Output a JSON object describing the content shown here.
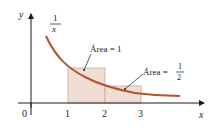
{
  "diagram": {
    "function_label": {
      "numerator": "1",
      "denominator": "x"
    },
    "axis": {
      "x_label": "x",
      "y_label": "y",
      "origin": "0",
      "ticks": [
        "1",
        "2",
        "3"
      ]
    },
    "annotations": {
      "area_one": "Área = 1",
      "area_half_prefix": "Área =",
      "area_half_num": "1",
      "area_half_den": "2"
    },
    "colors": {
      "curve": "#b0552f",
      "rect_fill": "#f0ddd4",
      "rect_stroke": "#c9a898",
      "axis": "#1a1a1a"
    }
  }
}
